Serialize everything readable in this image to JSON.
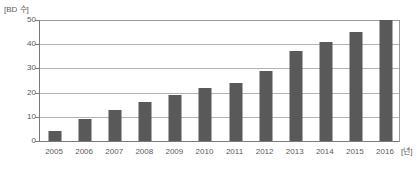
{
  "chart_data": {
    "type": "bar",
    "title": "",
    "subtitle": "",
    "xlabel": "[년]",
    "ylabel": "[BD 수]",
    "categories": [
      "2005",
      "2006",
      "2007",
      "2008",
      "2009",
      "2010",
      "2011",
      "2012",
      "2013",
      "2014",
      "2015",
      "2016"
    ],
    "values": [
      4,
      9,
      13,
      16,
      19,
      22,
      24,
      29,
      37,
      41,
      45,
      50
    ],
    "series": [
      {
        "name": "BD 수",
        "values": [
          4,
          9,
          13,
          16,
          19,
          22,
          24,
          29,
          37,
          41,
          45,
          50
        ]
      }
    ],
    "ylim": [
      0,
      50
    ],
    "y_ticks": [
      "0",
      "10",
      "20",
      "30",
      "40",
      "50"
    ],
    "y_tick_values": [
      0,
      10,
      20,
      30,
      40,
      50
    ],
    "grid": true,
    "legend": false,
    "legend_position": "none",
    "bar_color": "#595959",
    "gridline_color": "#b3b3b3",
    "axis_color": "#7a7a7a",
    "text_color": "#5a5a5a",
    "background_color": "#ffffff"
  }
}
